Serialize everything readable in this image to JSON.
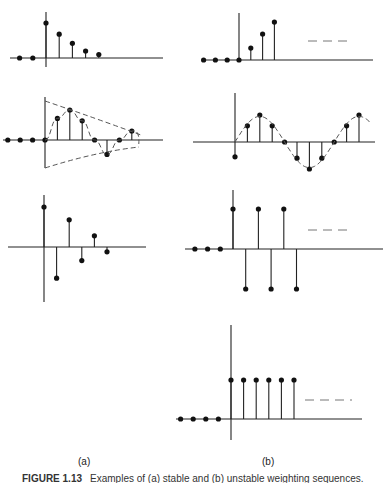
{
  "figure": {
    "label_a": "(a)",
    "label_b": "(b)",
    "caption_number": "FIGURE 1.13",
    "caption_text": "Examples of (a) stable and (b) unstable weighting sequences."
  },
  "chart_data": [
    {
      "id": "a1",
      "type": "stem",
      "column": "a",
      "description": "decaying positive sequence",
      "n": [
        -2,
        -1,
        0,
        1,
        2,
        3,
        4
      ],
      "values": [
        0,
        0,
        1.0,
        0.68,
        0.42,
        0.2,
        0.1
      ],
      "continues": false
    },
    {
      "id": "a2",
      "type": "stem",
      "column": "a",
      "description": "decaying oscillation with envelope",
      "n": [
        -3,
        -2,
        -1,
        0,
        1,
        2,
        3,
        4,
        5,
        6,
        7
      ],
      "values": [
        0,
        0,
        0,
        0,
        0.72,
        1.0,
        0.64,
        0,
        -0.48,
        0,
        0.3
      ],
      "envelope": true,
      "continues": false
    },
    {
      "id": "a3",
      "type": "stem",
      "column": "a",
      "description": "alternating decaying sequence",
      "n": [
        0,
        1,
        2,
        3,
        4,
        5
      ],
      "values": [
        1.0,
        -0.78,
        0.68,
        -0.34,
        0.28,
        -0.12
      ],
      "continues": false
    },
    {
      "id": "b1",
      "type": "stem",
      "column": "b",
      "description": "growing sequence",
      "n": [
        -3,
        -2,
        -1,
        0,
        1,
        2,
        3
      ],
      "values": [
        0,
        0,
        0,
        0,
        0.23,
        0.5,
        0.73,
        1.0
      ],
      "continues": true
    },
    {
      "id": "b2",
      "type": "stem",
      "column": "b",
      "description": "sustained sinusoid",
      "n": [
        0,
        1,
        2,
        3,
        4,
        5,
        6,
        7,
        8,
        9,
        10
      ],
      "values": [
        -0.55,
        0.6,
        1.0,
        0.6,
        0,
        -0.6,
        -1.0,
        -0.6,
        0,
        0.6,
        1.0
      ],
      "continues": false
    },
    {
      "id": "b3",
      "type": "stem",
      "column": "b",
      "description": "alternating constant magnitude",
      "n": [
        -3,
        -2,
        -1,
        0,
        1,
        2,
        3,
        4,
        5
      ],
      "values": [
        0,
        0,
        0,
        1,
        -1,
        1,
        -1,
        1,
        -1
      ],
      "continues": true
    },
    {
      "id": "b4",
      "type": "stem",
      "column": "b",
      "description": "unit step",
      "n": [
        -4,
        -3,
        -2,
        -1,
        0,
        1,
        2,
        3,
        4,
        5
      ],
      "values": [
        0,
        0,
        0,
        0,
        1,
        1,
        1,
        1,
        1,
        1
      ],
      "continues": true
    }
  ]
}
